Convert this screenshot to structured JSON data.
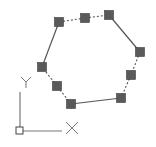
{
  "drawing": {
    "stroke_color": "#555555",
    "grip_fill": "#5a5a5a",
    "grip_stroke": "#3c3c3c",
    "grip_size": 9,
    "grips": [
      {
        "id": "grip-1",
        "x": 59,
        "y": 22
      },
      {
        "id": "grip-2",
        "x": 85,
        "y": 18
      },
      {
        "id": "grip-3",
        "x": 109,
        "y": 15
      },
      {
        "id": "grip-4",
        "x": 140,
        "y": 52
      },
      {
        "id": "grip-5",
        "x": 131,
        "y": 75
      },
      {
        "id": "grip-6",
        "x": 121,
        "y": 98
      },
      {
        "id": "grip-7",
        "x": 71,
        "y": 104
      },
      {
        "id": "grip-8",
        "x": 57,
        "y": 86
      },
      {
        "id": "grip-9",
        "x": 42,
        "y": 67
      }
    ],
    "segments": [
      {
        "from": 0,
        "to": 1,
        "style": "dashed"
      },
      {
        "from": 1,
        "to": 2,
        "style": "dashed"
      },
      {
        "from": 2,
        "to": 3,
        "style": "solid"
      },
      {
        "from": 3,
        "to": 4,
        "style": "dashed"
      },
      {
        "from": 4,
        "to": 5,
        "style": "dashed"
      },
      {
        "from": 5,
        "to": 6,
        "style": "solid"
      },
      {
        "from": 6,
        "to": 7,
        "style": "dashed"
      },
      {
        "from": 7,
        "to": 8,
        "style": "dashed"
      },
      {
        "from": 8,
        "to": 0,
        "style": "solid"
      }
    ]
  },
  "ucs_icon": {
    "color": "#777777",
    "origin": {
      "x": 20,
      "y": 131
    },
    "y_axis_end": {
      "x": 20,
      "y": 92
    },
    "x_axis_end": {
      "x": 62,
      "y": 131
    },
    "x_label": "X",
    "y_label": "Y"
  }
}
